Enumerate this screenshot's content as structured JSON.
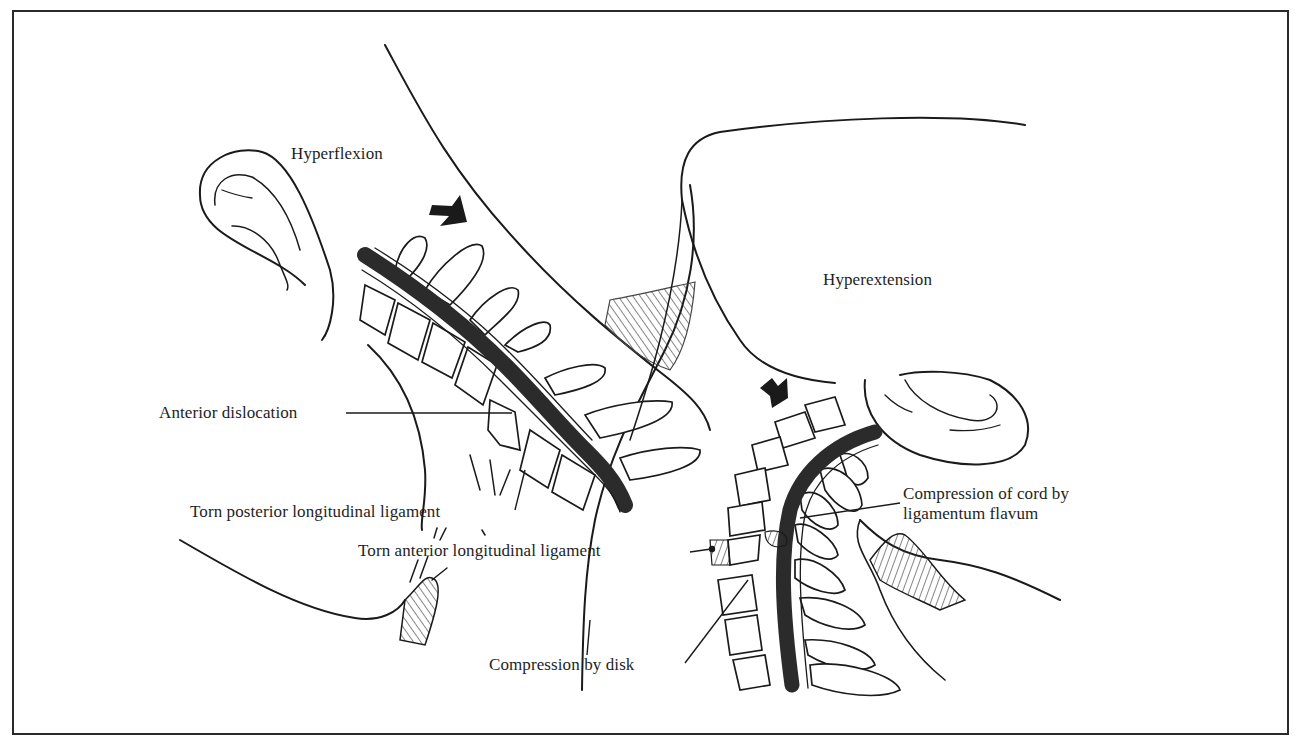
{
  "figure": {
    "type": "medical-illustration"
  },
  "panels": {
    "left": {
      "title": "Hyperflexion",
      "labels": {
        "anterior_dislocation": "Anterior dislocation",
        "torn_posterior": "Torn posterior longitudinal ligament",
        "torn_anterior": "Torn anterior longitudinal ligament"
      }
    },
    "right": {
      "title": "Hyperextension",
      "labels": {
        "compression_cord_line1": "Compression of cord by",
        "compression_cord_line2": "ligamentum flavum",
        "compression_disk": "Compression by disk"
      }
    }
  },
  "colors": {
    "ink": "#1a1a1a",
    "cord": "#2b2b2b",
    "background": "#ffffff",
    "frame": "#2a2a2a"
  }
}
